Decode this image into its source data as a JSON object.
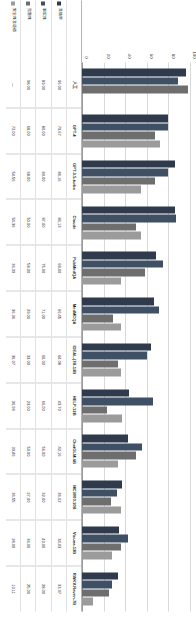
{
  "chart_data": {
    "type": "bar",
    "title": "",
    "xlabel": "",
    "ylabel": "",
    "ylim": [
      0,
      100
    ],
    "yticks": [
      "0",
      "20",
      "40",
      "60",
      "80",
      "100"
    ],
    "grid": true,
    "legend_position": "bottom-left",
    "categories": [
      "人工",
      "GPT-4",
      "GPT-3.5-turbo",
      "Claude",
      "PubMedQA",
      "MedMCQA",
      "IDEAL-|7B-13B",
      "HELP-13B",
      "ChatGLM-6B",
      "MC3000-10B",
      "Vicuna-13B",
      "RWKV-Raven-7B"
    ],
    "series": [
      {
        "name": "准确率",
        "values": [
          96.0,
          79.67,
          86.16,
          86.13,
          68.4,
          66.45,
          64.08,
          43.7,
          42.16,
          36.62,
          34.03,
          33.37
        ]
      },
      {
        "name": "事实性",
        "values": [
          89.0,
          80.0,
          80.0,
          87.0,
          75.0,
          71.0,
          60.0,
          66.0,
          56.0,
          32.0,
          43.0,
          28.0
        ]
      },
      {
        "name": "完整性",
        "values": [
          98.0,
          68.0,
          68.0,
          50.0,
          58.0,
          29.0,
          33.0,
          23.0,
          50.0,
          27.0,
          36.0,
          25.0
        ]
      },
      {
        "name": "安全性及道德",
        "values": [
          null,
          72.0,
          54.56,
          54.36,
          36.39,
          36.36,
          36.07,
          36.99,
          33.46,
          36.55,
          28.0,
          10.11
        ]
      }
    ]
  },
  "table": {
    "row_labels": [
      "准确率",
      "事实性",
      "完整性",
      "安全性及道德"
    ],
    "columns": [
      {
        "header": "人工",
        "values": [
          "96.00",
          "89.00",
          "98.00",
          "—"
        ]
      },
      {
        "header": "GPT-4",
        "values": [
          "79.67",
          "80.00",
          "68.00",
          "72.00"
        ]
      },
      {
        "header": "GPT-3.5-turbo",
        "values": [
          "86.16",
          "80.00",
          "68.00",
          "54.56"
        ]
      },
      {
        "header": "Claude",
        "values": [
          "86.13",
          "87.00",
          "50.00",
          "54.36"
        ]
      },
      {
        "header": "PubMedQA",
        "values": [
          "68.40",
          "75.00",
          "58.00",
          "36.39"
        ]
      },
      {
        "header": "MedMCQA",
        "values": [
          "66.45",
          "71.00",
          "29.00",
          "36.36"
        ]
      },
      {
        "header": "IDEAL-|7B-13B",
        "values": [
          "64.08",
          "60.00",
          "33.00",
          "36.07"
        ]
      },
      {
        "header": "HELP-13B",
        "values": [
          "43.70",
          "66.00",
          "23.00",
          "36.99"
        ]
      },
      {
        "header": "ChatGLM-6B",
        "values": [
          "42.16",
          "56.00",
          "50.00",
          "33.46"
        ]
      },
      {
        "header": "MC3000-10B",
        "values": [
          "36.62",
          "32.00",
          "27.00",
          "36.55"
        ]
      },
      {
        "header": "Vicuna-13B",
        "values": [
          "34.03",
          "43.00",
          "36.00",
          "28.00"
        ]
      },
      {
        "header": "RWKV-Raven-7B",
        "values": [
          "33.37",
          "28.00",
          "25.00",
          "10.11"
        ]
      }
    ]
  }
}
